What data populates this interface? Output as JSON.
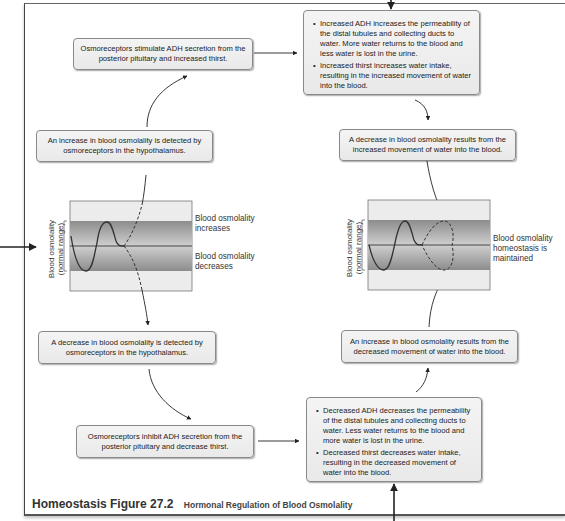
{
  "figure": {
    "label": "Homeostasis Figure 27.2",
    "title": "Hormonal Regulation of Blood Osmolality"
  },
  "left_branch": {
    "increase_detected": "An increase in blood osmolality is detected by osmoreceptors in the hypothalamus.",
    "stimulate_adh": "Osmoreceptors stimulate ADH secretion from the posterior pituitary and increased thirst.",
    "decrease_detected": "A decrease in blood osmolality is detected by osmoreceptors in the hypothalamus.",
    "inhibit_adh": "Osmoreceptors inhibit ADH secretion from the posterior pituitary and decrease thirst."
  },
  "right_branch": {
    "increased_adh_bullets": [
      "Increased ADH increases the permeability of the distal tubules and collecting ducts to water. More water returns to the blood and less water is lost in the urine.",
      "Increased thirst increases water intake, resulting in the increased movement of water into the blood."
    ],
    "decrease_results": "A decrease in blood osmolality results from the increased movement of water into the blood.",
    "increase_results": "An increase in blood osmolality results from the decreased movement of water into the blood.",
    "decreased_adh_bullets": [
      "Decreased ADH decreases the permeability of the distal tubules and collecting ducts to water. Less water returns to the blood and more water is lost in the urine.",
      "Decreased thirst decreases water intake, resulting in the decreased movement of water into the blood."
    ]
  },
  "graphs": {
    "left": {
      "ylabel_line1": "Blood osmolality",
      "ylabel_line2": "(normal range)",
      "upper_label": "Blood osmolality increases",
      "lower_label": "Blood osmolality decreases"
    },
    "right": {
      "ylabel_line1": "Blood osmolality",
      "ylabel_line2": "(normal range)",
      "state_label": "Blood osmolality homeostasis is maintained"
    }
  },
  "colors": {
    "box_bg": "#eeeeee",
    "box_border": "#8a8a8a",
    "band_dark": "#8f8f8f",
    "band_light": "#e6e6e6",
    "line": "#333333"
  }
}
